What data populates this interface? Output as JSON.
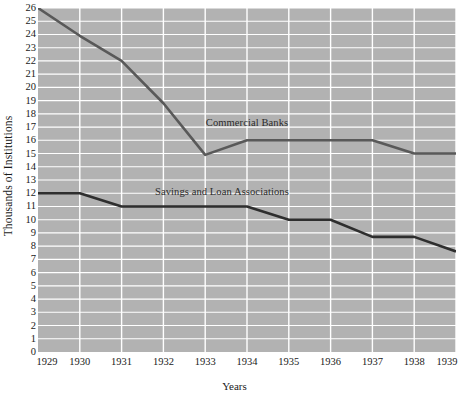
{
  "chart_data": {
    "type": "line",
    "title": "",
    "xlabel": "Years",
    "ylabel": "Thousands of Institutions",
    "x": [
      1929,
      1930,
      1931,
      1932,
      1933,
      1934,
      1935,
      1936,
      1937,
      1938,
      1939
    ],
    "categories": [
      "1929",
      "1930",
      "1931",
      "1932",
      "1933",
      "1934",
      "1935",
      "1936",
      "1937",
      "1938",
      "1939"
    ],
    "xlim": [
      1929,
      1939
    ],
    "ylim": [
      0,
      26
    ],
    "yticks": [
      0,
      1,
      2,
      3,
      4,
      5,
      6,
      7,
      8,
      9,
      10,
      11,
      12,
      13,
      14,
      15,
      16,
      17,
      18,
      19,
      20,
      21,
      22,
      23,
      24,
      25,
      26
    ],
    "ytick_labels": [
      "0",
      "1",
      "2",
      "3",
      "4",
      "5",
      "6",
      "7",
      "8",
      "9",
      "10",
      "11",
      "12",
      "13",
      "14",
      "15",
      "16",
      "17",
      "18",
      "19",
      "20",
      "21",
      "22",
      "23",
      "24",
      "25",
      "26"
    ],
    "grid": true,
    "grid_color": "#ffffff",
    "plot_background": "#b2b2b2",
    "page_background": "#ffffff",
    "legend_position": "inline-annotation",
    "series": [
      {
        "name": "Commercial Banks",
        "label_text": "Commercial Banks",
        "color": "#595959",
        "values": [
          26.0,
          23.9,
          22.0,
          18.8,
          14.9,
          16.0,
          16.0,
          16.0,
          16.0,
          15.0,
          15.0
        ]
      },
      {
        "name": "Savings and Loan Associations",
        "label_text": "Savings and Loan Associations",
        "color": "#2e2e2e",
        "values": [
          12.0,
          12.0,
          11.0,
          11.0,
          11.0,
          11.0,
          10.0,
          10.0,
          8.7,
          8.7,
          7.6
        ]
      }
    ],
    "annotations": [
      {
        "text": "Commercial Banks",
        "x": 1934.0,
        "y": 17.3
      },
      {
        "text": "Savings and Loan Associations",
        "x": 1933.4,
        "y": 12.1
      }
    ]
  }
}
